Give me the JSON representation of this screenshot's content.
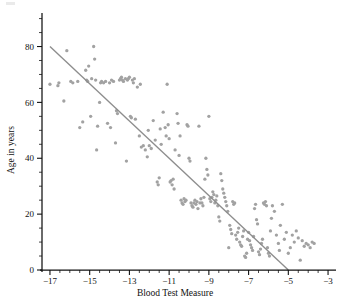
{
  "figure": {
    "background_color": "#ffffff",
    "point_color": "#a2a2a2",
    "line_color": "#8d8d8d",
    "axis_color": "#111111"
  },
  "chart_data": {
    "type": "scatter",
    "title": "",
    "subtitle": "",
    "xlabel": "Blood Test Measure",
    "ylabel": "Age in years",
    "xlim": [
      -17.4,
      -2.6
    ],
    "ylim": [
      0,
      92
    ],
    "grid": false,
    "legend": null,
    "legend_position": "none",
    "x_ticks": [
      -17,
      -15,
      -13,
      -11,
      -9,
      -7,
      -5,
      -3
    ],
    "x_tick_labels": [
      "−17",
      "−15",
      "−13",
      "−11",
      "−9",
      "−7",
      "−5",
      "−3"
    ],
    "x_minor_tick_step": 0.5,
    "y_ticks": [
      0,
      20,
      40,
      60,
      80
    ],
    "y_tick_labels": [
      "0",
      "20",
      "40",
      "60",
      "80"
    ],
    "y_minor_tick_step": 5,
    "trend_line": {
      "name": "least-squares fit",
      "x_start": -17.0,
      "y_start": 80.0,
      "x_end": -5.0,
      "y_end": 0.0,
      "slope": -6.6667,
      "intercept": -33.333
    },
    "series": [
      {
        "name": "patients",
        "marker": "circle",
        "color": "#a2a2a2",
        "n_points": 196,
        "points": [
          [
            -17.0,
            66.5
          ],
          [
            -16.6,
            66.0
          ],
          [
            -16.55,
            67.0
          ],
          [
            -16.3,
            60.5
          ],
          [
            -16.15,
            78.5
          ],
          [
            -15.95,
            67.5
          ],
          [
            -15.85,
            67.0
          ],
          [
            -15.6,
            67.5
          ],
          [
            -15.5,
            51.0
          ],
          [
            -15.35,
            53.0
          ],
          [
            -15.2,
            71.5
          ],
          [
            -15.15,
            68.0
          ],
          [
            -15.1,
            67.5
          ],
          [
            -15.05,
            73.0
          ],
          [
            -14.95,
            55.0
          ],
          [
            -14.9,
            68.5
          ],
          [
            -14.8,
            80.0
          ],
          [
            -14.75,
            75.5
          ],
          [
            -14.7,
            68.0
          ],
          [
            -14.65,
            43.0
          ],
          [
            -14.6,
            51.5
          ],
          [
            -14.5,
            60.0
          ],
          [
            -14.45,
            67.0
          ],
          [
            -14.4,
            67.5
          ],
          [
            -14.3,
            67.0
          ],
          [
            -14.2,
            67.5
          ],
          [
            -14.1,
            52.5
          ],
          [
            -14.0,
            67.0
          ],
          [
            -13.95,
            51.0
          ],
          [
            -13.9,
            68.0
          ],
          [
            -13.8,
            67.5
          ],
          [
            -13.7,
            45.5
          ],
          [
            -13.65,
            57.0
          ],
          [
            -13.6,
            56.0
          ],
          [
            -13.5,
            68.0
          ],
          [
            -13.45,
            68.5
          ],
          [
            -13.4,
            69.0
          ],
          [
            -13.35,
            68.0
          ],
          [
            -13.3,
            67.5
          ],
          [
            -13.2,
            68.5
          ],
          [
            -13.15,
            39.0
          ],
          [
            -13.1,
            68.0
          ],
          [
            -13.05,
            68.5
          ],
          [
            -13.0,
            69.0
          ],
          [
            -12.95,
            55.0
          ],
          [
            -12.9,
            54.5
          ],
          [
            -12.85,
            68.0
          ],
          [
            -12.8,
            67.0
          ],
          [
            -12.75,
            68.5
          ],
          [
            -12.7,
            54.0
          ],
          [
            -12.6,
            65.5
          ],
          [
            -12.5,
            48.0
          ],
          [
            -12.45,
            66.5
          ],
          [
            -12.4,
            44.0
          ],
          [
            -12.3,
            44.5
          ],
          [
            -12.2,
            43.0
          ],
          [
            -12.1,
            40.5
          ],
          [
            -12.05,
            50.0
          ],
          [
            -12.0,
            44.5
          ],
          [
            -11.9,
            43.5
          ],
          [
            -11.8,
            53.5
          ],
          [
            -11.7,
            46.5
          ],
          [
            -11.6,
            31.5
          ],
          [
            -11.55,
            30.5
          ],
          [
            -11.5,
            33.0
          ],
          [
            -11.45,
            50.5
          ],
          [
            -11.4,
            45.0
          ],
          [
            -11.3,
            56.5
          ],
          [
            -11.2,
            51.0
          ],
          [
            -11.15,
            48.0
          ],
          [
            -11.1,
            66.5
          ],
          [
            -11.05,
            52.0
          ],
          [
            -11.0,
            47.0
          ],
          [
            -10.95,
            31.5
          ],
          [
            -10.9,
            32.0
          ],
          [
            -10.85,
            30.5
          ],
          [
            -10.8,
            32.5
          ],
          [
            -10.75,
            29.0
          ],
          [
            -10.7,
            43.0
          ],
          [
            -10.6,
            56.0
          ],
          [
            -10.55,
            52.5
          ],
          [
            -10.5,
            41.0
          ],
          [
            -10.45,
            48.0
          ],
          [
            -10.4,
            25.0
          ],
          [
            -10.35,
            24.0
          ],
          [
            -10.3,
            23.5
          ],
          [
            -10.25,
            25.5
          ],
          [
            -10.2,
            24.5
          ],
          [
            -10.15,
            25.0
          ],
          [
            -10.1,
            52.0
          ],
          [
            -10.05,
            51.5
          ],
          [
            -10.0,
            40.0
          ],
          [
            -9.95,
            39.0
          ],
          [
            -9.9,
            24.0
          ],
          [
            -9.85,
            23.0
          ],
          [
            -9.8,
            22.5
          ],
          [
            -9.75,
            24.0
          ],
          [
            -9.7,
            25.0
          ],
          [
            -9.65,
            23.5
          ],
          [
            -9.6,
            24.5
          ],
          [
            -9.55,
            22.0
          ],
          [
            -9.5,
            51.5
          ],
          [
            -9.45,
            24.0
          ],
          [
            -9.4,
            25.5
          ],
          [
            -9.35,
            24.0
          ],
          [
            -9.3,
            23.0
          ],
          [
            -9.25,
            26.0
          ],
          [
            -9.2,
            32.5
          ],
          [
            -9.15,
            40.0
          ],
          [
            -9.1,
            36.0
          ],
          [
            -9.05,
            34.0
          ],
          [
            -9.0,
            55.0
          ],
          [
            -8.95,
            25.5
          ],
          [
            -8.9,
            24.5
          ],
          [
            -8.85,
            26.0
          ],
          [
            -8.8,
            28.0
          ],
          [
            -8.75,
            27.0
          ],
          [
            -8.7,
            24.0
          ],
          [
            -8.65,
            25.0
          ],
          [
            -8.6,
            26.5
          ],
          [
            -8.55,
            23.0
          ],
          [
            -8.5,
            19.0
          ],
          [
            -8.45,
            17.5
          ],
          [
            -8.4,
            34.5
          ],
          [
            -8.35,
            32.0
          ],
          [
            -8.3,
            29.0
          ],
          [
            -8.25,
            27.5
          ],
          [
            -8.2,
            26.0
          ],
          [
            -8.15,
            24.5
          ],
          [
            -8.1,
            23.0
          ],
          [
            -8.05,
            21.0
          ],
          [
            -8.0,
            8.0
          ],
          [
            -7.95,
            16.0
          ],
          [
            -7.9,
            14.5
          ],
          [
            -7.85,
            13.0
          ],
          [
            -7.8,
            24.5
          ],
          [
            -7.75,
            23.5
          ],
          [
            -7.7,
            24.0
          ],
          [
            -7.65,
            12.5
          ],
          [
            -7.6,
            11.0
          ],
          [
            -7.55,
            13.5
          ],
          [
            -7.5,
            15.0
          ],
          [
            -7.45,
            10.0
          ],
          [
            -7.4,
            9.0
          ],
          [
            -7.35,
            8.5
          ],
          [
            -7.3,
            12.0
          ],
          [
            -7.25,
            14.0
          ],
          [
            -7.2,
            5.0
          ],
          [
            -7.15,
            4.5
          ],
          [
            -7.1,
            6.0
          ],
          [
            -7.05,
            11.0
          ],
          [
            -7.0,
            13.5
          ],
          [
            -6.95,
            10.5
          ],
          [
            -6.9,
            9.0
          ],
          [
            -6.85,
            8.0
          ],
          [
            -6.8,
            7.0
          ],
          [
            -6.75,
            12.0
          ],
          [
            -6.7,
            22.0
          ],
          [
            -6.65,
            23.5
          ],
          [
            -6.6,
            18.0
          ],
          [
            -6.55,
            16.5
          ],
          [
            -6.5,
            6.5
          ],
          [
            -6.45,
            5.5
          ],
          [
            -6.4,
            7.5
          ],
          [
            -6.35,
            9.5
          ],
          [
            -6.3,
            11.0
          ],
          [
            -6.25,
            24.0
          ],
          [
            -6.2,
            23.5
          ],
          [
            -6.15,
            24.5
          ],
          [
            -6.1,
            23.0
          ],
          [
            -6.05,
            8.0
          ],
          [
            -6.0,
            6.0
          ],
          [
            -5.95,
            5.0
          ],
          [
            -5.9,
            14.0
          ],
          [
            -5.85,
            18.5
          ],
          [
            -5.8,
            23.0
          ],
          [
            -5.7,
            21.0
          ],
          [
            -5.6,
            12.5
          ],
          [
            -5.5,
            9.5
          ],
          [
            -5.45,
            7.0
          ],
          [
            -5.4,
            16.0
          ],
          [
            -5.3,
            23.5
          ],
          [
            -5.2,
            11.0
          ],
          [
            -5.1,
            13.5
          ],
          [
            -5.0,
            6.0
          ],
          [
            -4.9,
            8.0
          ],
          [
            -4.8,
            12.5
          ],
          [
            -4.7,
            10.0
          ],
          [
            -4.6,
            14.0
          ],
          [
            -4.5,
            11.5
          ],
          [
            -4.4,
            3.5
          ],
          [
            -4.3,
            10.5
          ],
          [
            -4.2,
            8.5
          ],
          [
            -4.1,
            9.5
          ],
          [
            -4.0,
            9.0
          ],
          [
            -3.9,
            8.0
          ],
          [
            -3.8,
            10.0
          ],
          [
            -3.7,
            9.5
          ]
        ]
      }
    ]
  }
}
